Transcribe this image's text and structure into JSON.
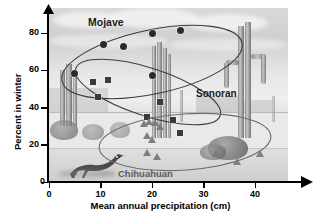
{
  "chart_data": {
    "type": "scatter",
    "title": "",
    "xlabel": "Mean annual precipitation (cm)",
    "ylabel": "Percent in winter",
    "xlim": [
      0,
      44
    ],
    "ylim": [
      0,
      88
    ],
    "xticks": [
      "0",
      "10",
      "20",
      "30",
      "40"
    ],
    "xtick_values": [
      0,
      10,
      20,
      30,
      40
    ],
    "yticks": [
      "0",
      "20",
      "40",
      "60",
      "80"
    ],
    "ytick_values": [
      0,
      20,
      40,
      60,
      80
    ],
    "grid": false,
    "legend": "inline-annotations",
    "background": "desert-photograph",
    "series": [
      {
        "name": "Mojave",
        "marker": "circle",
        "color": "#2b2b2b",
        "points": [
          {
            "x": 5.0,
            "y": 58.5
          },
          {
            "x": 10.5,
            "y": 74.0
          },
          {
            "x": 14.5,
            "y": 72.5
          },
          {
            "x": 20.0,
            "y": 80.0
          },
          {
            "x": 25.5,
            "y": 81.5
          },
          {
            "x": 20.0,
            "y": 57.0
          }
        ]
      },
      {
        "name": "Sonoran",
        "marker": "square",
        "color": "#3a3a3a",
        "points": [
          {
            "x": 8.5,
            "y": 53.5
          },
          {
            "x": 11.5,
            "y": 55.0
          },
          {
            "x": 9.5,
            "y": 45.5
          },
          {
            "x": 21.5,
            "y": 43.0
          },
          {
            "x": 19.0,
            "y": 35.0
          },
          {
            "x": 24.0,
            "y": 33.5
          },
          {
            "x": 25.5,
            "y": 26.5
          }
        ]
      },
      {
        "name": "Chihuahuan",
        "marker": "triangle",
        "color": "#7a7a7a",
        "points": [
          {
            "x": 18.5,
            "y": 31.0
          },
          {
            "x": 19.5,
            "y": 32.0
          },
          {
            "x": 20.5,
            "y": 31.5
          },
          {
            "x": 21.5,
            "y": 29.5
          },
          {
            "x": 19.0,
            "y": 24.5
          },
          {
            "x": 20.0,
            "y": 22.5
          },
          {
            "x": 19.0,
            "y": 15.5
          },
          {
            "x": 21.0,
            "y": 13.5
          },
          {
            "x": 32.5,
            "y": 15.0
          },
          {
            "x": 36.5,
            "y": 11.0
          },
          {
            "x": 41.0,
            "y": 15.0
          }
        ]
      }
    ],
    "annotations": [
      {
        "text": "Mojave",
        "x": 9.0,
        "y": 86.0
      },
      {
        "text": "Sonoran",
        "x": 25.0,
        "y": 46.0
      },
      {
        "text": "Chihuahuan",
        "x": 16.0,
        "y": 3.0
      }
    ]
  },
  "axes": {
    "y_label": "Percent in winter",
    "x_label": "Mean annual precipitation (cm)",
    "y_ticks": [
      "80",
      "60",
      "40",
      "20",
      "0"
    ],
    "x_ticks": [
      "0",
      "10",
      "20",
      "30",
      "40"
    ]
  },
  "groups": {
    "mojave_label": "Mojave",
    "sonoran_label": "Sonoran",
    "chihuahuan_label": "Chihuahuan"
  }
}
